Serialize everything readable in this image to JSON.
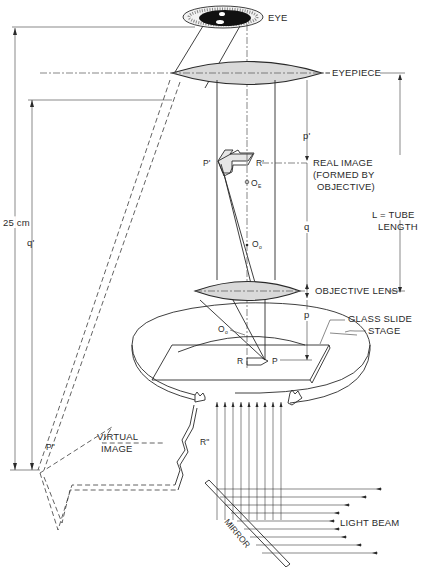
{
  "diagram": {
    "colors": {
      "ink": "#2a2a2a",
      "lens_fill": "#d9d9d9",
      "background": "#ffffff"
    },
    "labels": {
      "eye": "EYE",
      "eyepiece": "EYEPIECE",
      "p_prime": "p'",
      "real_image_line1": "REAL IMAGE",
      "real_image_line2": "(FORMED BY",
      "real_image_line3": "OBJECTIVE)",
      "tube_length_line1": "L = TUBE",
      "tube_length_line2": "LENGTH",
      "q": "q",
      "objective_lens": "OBJECTIVE LENS",
      "p": "p",
      "glass_slide": "GLASS SLIDE",
      "stage": "STAGE",
      "distance_25cm": "25 cm",
      "q_prime": "q'",
      "virtual_image_line1": "VIRTUAL",
      "virtual_image_line2": "IMAGE",
      "light_beam": "LIGHT BEAM",
      "mirror": "MIRROR"
    },
    "points": {
      "P_prime": "P'",
      "R_prime": "R'",
      "O_E": "O",
      "O_E_sub": "E",
      "O_o": "O",
      "O_o_sub": "o",
      "O_o2": "O",
      "O_o2_sub": "o",
      "R": "R",
      "P": "P",
      "P_double": "P\"",
      "R_double": "R\""
    }
  }
}
